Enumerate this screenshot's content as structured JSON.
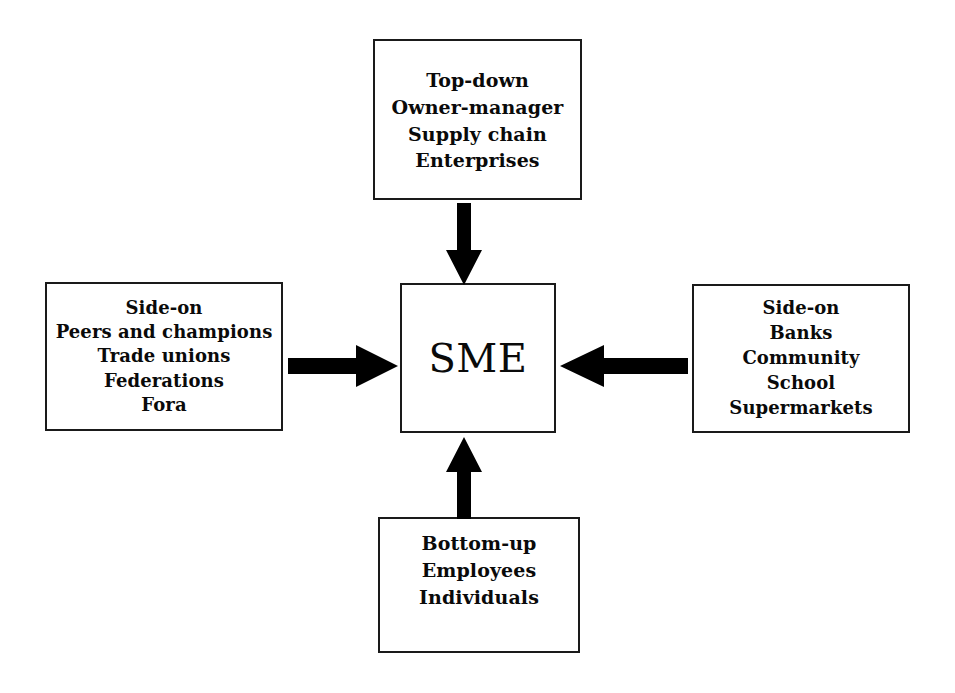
{
  "diagram": {
    "center": {
      "label": "SME"
    },
    "nodes": {
      "top": {
        "name": "top-down-influences",
        "lines": [
          "Top-down",
          "Owner-manager",
          "Supply chain",
          "Enterprises"
        ]
      },
      "left": {
        "name": "side-on-peer-influences",
        "lines": [
          "Side-on",
          "Peers and champions",
          "Trade unions",
          "Federations",
          "Fora"
        ]
      },
      "right": {
        "name": "side-on-external-influences",
        "lines": [
          "Side-on",
          "Banks",
          "Community",
          "School",
          "Supermarkets"
        ]
      },
      "bottom": {
        "name": "bottom-up-influences",
        "lines": [
          "Bottom-up",
          "Employees",
          "Individuals"
        ]
      }
    },
    "arrows": [
      {
        "id": "arrow-top",
        "icon": "arrow-down-icon",
        "from": "top",
        "to": "center",
        "direction": "down"
      },
      {
        "id": "arrow-bottom",
        "icon": "arrow-up-icon",
        "from": "bottom",
        "to": "center",
        "direction": "up"
      },
      {
        "id": "arrow-left",
        "icon": "arrow-right-icon",
        "from": "left",
        "to": "center",
        "direction": "right"
      },
      {
        "id": "arrow-right",
        "icon": "arrow-left-icon",
        "from": "right",
        "to": "center",
        "direction": "left"
      }
    ],
    "colors": {
      "stroke": "#1a1a1a",
      "arrow_fill": "#000000",
      "background": "#ffffff",
      "text": "#0a0a0a"
    }
  }
}
